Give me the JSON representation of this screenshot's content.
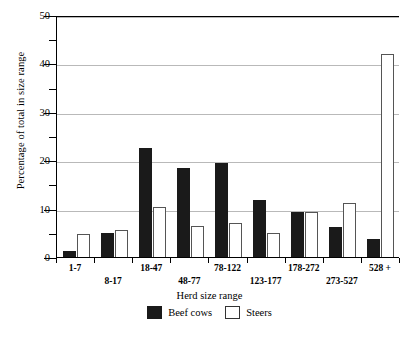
{
  "chart_data": {
    "type": "bar",
    "title": "",
    "xlabel": "Herd size range",
    "ylabel": "Percentage of total in size range",
    "categories": [
      "1-7",
      "8-17",
      "18-47",
      "48-77",
      "78-122",
      "123-177",
      "178-272",
      "273-527",
      "528 +"
    ],
    "series": [
      {
        "name": "Beef cows",
        "color": "#1a1a1a",
        "values": [
          1.4,
          5.2,
          22.7,
          18.7,
          19.6,
          12.0,
          9.6,
          6.4,
          3.9
        ]
      },
      {
        "name": "Steers",
        "color": "#ffffff",
        "values": [
          5.0,
          5.7,
          10.6,
          6.6,
          7.3,
          5.1,
          9.5,
          11.4,
          42.1
        ]
      }
    ],
    "ylim": [
      0,
      50
    ],
    "yticks_major": [
      0,
      10,
      20,
      30,
      40,
      50
    ],
    "yticks_minor": [
      5,
      15,
      25,
      35,
      45
    ],
    "ytick_labels": [
      "0",
      "10",
      "20",
      "30",
      "40",
      "50"
    ],
    "grid": "horizontal",
    "legend_position": "bottom"
  },
  "legend": {
    "entries": [
      {
        "label": "Beef cows"
      },
      {
        "label": "Steers"
      }
    ]
  }
}
